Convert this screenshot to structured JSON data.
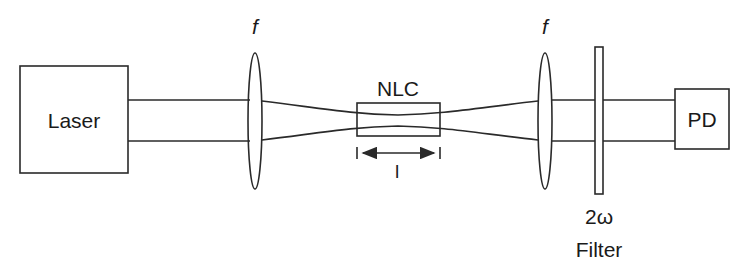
{
  "diagram": {
    "components": {
      "laser": {
        "label": "Laser"
      },
      "lens_1": {
        "label": "f"
      },
      "crystal": {
        "label": "NLC",
        "length_label": "l"
      },
      "lens_2": {
        "label": "f"
      },
      "filter": {
        "label_line1": "2ω",
        "label_line2": "Filter"
      },
      "detector": {
        "label": "PD"
      }
    },
    "colors": {
      "stroke": "#2a2a2a",
      "text": "#1a1a1a",
      "background": "#ffffff"
    }
  }
}
